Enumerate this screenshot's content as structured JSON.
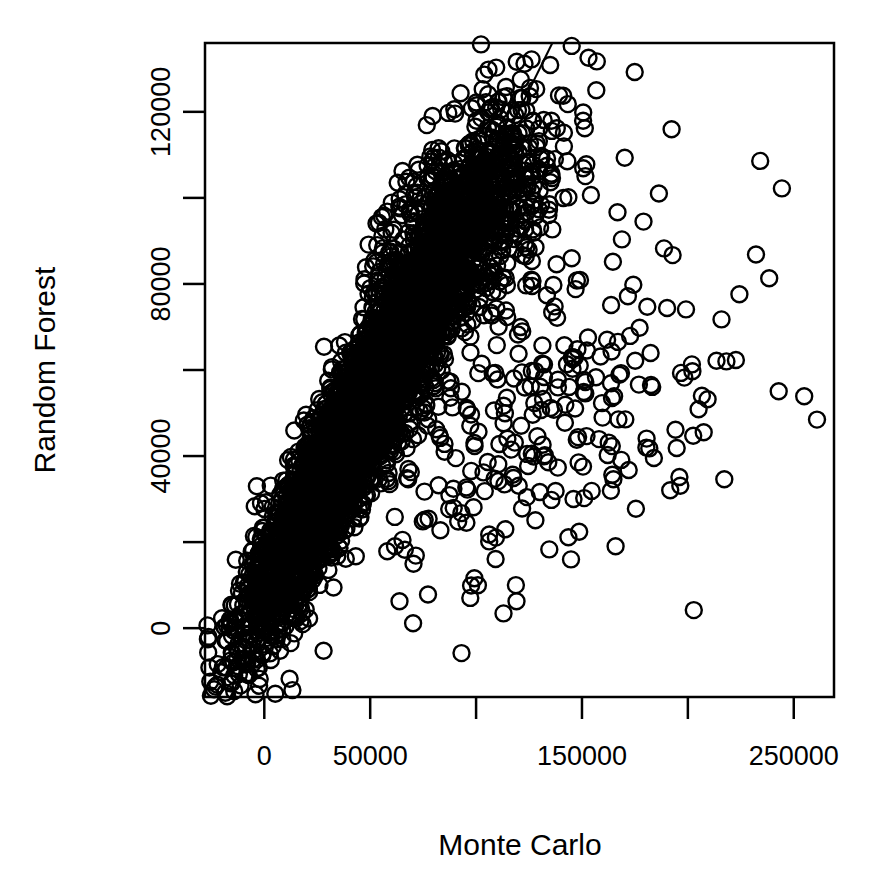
{
  "chart_data": {
    "type": "scatter",
    "title": "",
    "xlabel": "Monte Carlo",
    "ylabel": "Random Forest",
    "xlim": [
      -28000,
      269000
    ],
    "ylim": [
      -16000,
      136000
    ],
    "grid": false,
    "legend": null,
    "x_ticks": [
      {
        "value": 0,
        "label": "0",
        "labeled": true
      },
      {
        "value": 50000,
        "label": "50000",
        "labeled": true
      },
      {
        "value": 100000,
        "label": "",
        "labeled": false
      },
      {
        "value": 150000,
        "label": "150000",
        "labeled": true
      },
      {
        "value": 200000,
        "label": "",
        "labeled": false
      },
      {
        "value": 250000,
        "label": "250000",
        "labeled": true
      }
    ],
    "y_ticks": [
      {
        "value": 0,
        "label": "0",
        "labeled": true
      },
      {
        "value": 20000,
        "label": "",
        "labeled": false
      },
      {
        "value": 40000,
        "label": "40000",
        "labeled": true
      },
      {
        "value": 60000,
        "label": "",
        "labeled": false
      },
      {
        "value": 80000,
        "label": "80000",
        "labeled": true
      },
      {
        "value": 100000,
        "label": "",
        "labeled": false
      },
      {
        "value": 120000,
        "label": "120000",
        "labeled": true
      }
    ],
    "marker": {
      "shape": "open-circle",
      "radius_px": 8,
      "stroke_width_px": 2.4,
      "stroke_color": "#000000",
      "fill": "none"
    },
    "reference_line": {
      "kind": "identity",
      "description": "y = x reference line",
      "slope": 1,
      "intercept": 0,
      "color": "#000000",
      "width_px": 2
    },
    "annotations": [],
    "n_points_approx": 6000,
    "point_clusters": [
      {
        "name": "dense-core",
        "x_center": 42000,
        "y_center": 45000,
        "x_spread": 26000,
        "y_spread": 24000,
        "correlation": 0.93,
        "count": 4200
      },
      {
        "name": "upper-tail",
        "x_center": 95000,
        "y_center": 95000,
        "x_spread": 22000,
        "y_spread": 15000,
        "correlation": 0.55,
        "count": 900
      },
      {
        "name": "lower-right-fan",
        "x_center": 130000,
        "y_center": 48000,
        "x_spread": 45000,
        "y_spread": 22000,
        "correlation": 0.35,
        "count": 260
      },
      {
        "name": "far-outliers",
        "x_center": 215000,
        "y_center": 75000,
        "x_spread": 45000,
        "y_spread": 38000,
        "correlation": 0.1,
        "count": 30
      }
    ]
  },
  "axes": {
    "x_axis_name": "Monte Carlo",
    "y_axis_name": "Random Forest"
  }
}
